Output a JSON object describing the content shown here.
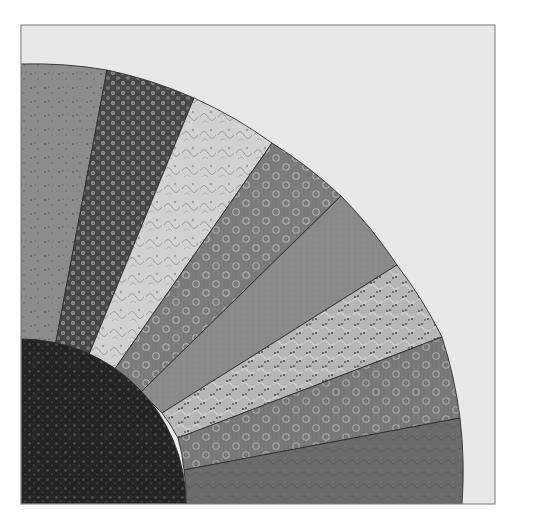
{
  "image": {
    "subject": "Grandmother's Fan quilt block (grayscale)",
    "width": 545,
    "height": 522
  },
  "block": {
    "x": 21,
    "y": 25,
    "width": 474,
    "height": 479,
    "background_color": "#e8e8e8",
    "border_color": "#8a8a8a"
  },
  "fan": {
    "center": [
      21,
      504
    ],
    "inner_radius": 165,
    "outer_radius": 441,
    "hub": {
      "name": "center-quarter-circle",
      "color": "#262626",
      "dot_color": "#4a4a4a"
    },
    "blades": [
      {
        "name": "blade-1",
        "pattern": "speckle",
        "base": "#8c8c8c",
        "accent": "#6a6a6a"
      },
      {
        "name": "blade-2",
        "pattern": "dense-floral",
        "base": "#4a4a4a",
        "accent": "#9a9a9a"
      },
      {
        "name": "blade-3",
        "pattern": "light-paisley",
        "base": "#cfcfcf",
        "accent": "#9a9a9a"
      },
      {
        "name": "blade-4",
        "pattern": "ring-flowers",
        "base": "#7c7c7c",
        "accent": "#b5b5b5"
      },
      {
        "name": "blade-5",
        "pattern": "solid-mottled",
        "base": "#8a8a8a",
        "accent": "#7a7a7a"
      },
      {
        "name": "blade-6",
        "pattern": "light-dotted-paisley",
        "base": "#b4b4b4",
        "accent": "#555555"
      },
      {
        "name": "blade-7",
        "pattern": "ring-flowers",
        "base": "#7a7a7a",
        "accent": "#b0b0b0"
      },
      {
        "name": "blade-8",
        "pattern": "dark-mottled",
        "base": "#6a6a6a",
        "accent": "#5a5a5a"
      }
    ],
    "outer_boundary_points": [
      [
        21,
        64
      ],
      [
        107,
        70
      ],
      [
        194,
        98
      ],
      [
        272,
        143
      ],
      [
        341,
        196
      ],
      [
        397,
        265
      ],
      [
        442,
        337
      ],
      [
        466,
        420
      ],
      [
        466,
        504
      ]
    ]
  }
}
